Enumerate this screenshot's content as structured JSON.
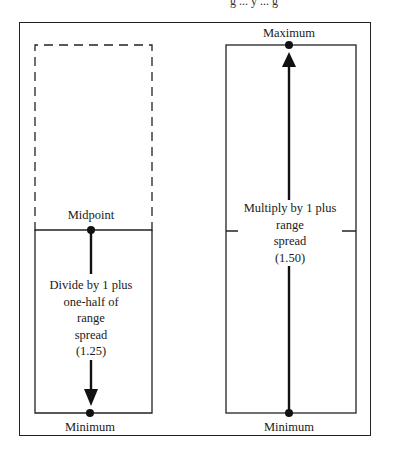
{
  "caption_fragment": "g ... y ... g",
  "diagram": {
    "left_panel": {
      "top_label": "Midpoint",
      "bottom_label": "Minimum",
      "instruction_lines": [
        "Divide by 1 plus",
        "one-half of",
        "range",
        "spread",
        "(1.25)"
      ],
      "arrow_direction": "down",
      "upper_half_style": "dashed"
    },
    "right_panel": {
      "top_label": "Maximum",
      "bottom_label": "Minimum",
      "instruction_lines": [
        "Multiply by 1 plus",
        "range",
        "spread",
        "(1.50)"
      ],
      "arrow_direction": "up",
      "upper_half_style": "solid"
    },
    "colors": {
      "line": "#1a1a1a",
      "background": "#ffffff"
    }
  }
}
